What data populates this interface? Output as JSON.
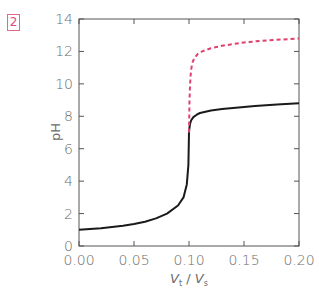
{
  "badge": "2",
  "chart_data": {
    "type": "line",
    "title": "",
    "xlabel": "Vt / Vs",
    "ylabel": "pH",
    "xlim": [
      0.0,
      0.2
    ],
    "ylim": [
      0,
      14
    ],
    "xticks": [
      "0.00",
      "0.05",
      "0.10",
      "0.15",
      "0.20"
    ],
    "yticks": [
      "0",
      "2",
      "4",
      "6",
      "8",
      "10",
      "12",
      "14"
    ],
    "grid": false,
    "legend": null,
    "series": [
      {
        "name": "solid-black-curve",
        "style": "solid",
        "color": "#1a1a1a",
        "x": [
          0.0,
          0.02,
          0.04,
          0.05,
          0.06,
          0.07,
          0.08,
          0.09,
          0.095,
          0.098,
          0.0995,
          0.1,
          0.1005,
          0.101,
          0.102,
          0.104,
          0.107,
          0.11,
          0.12,
          0.13,
          0.14,
          0.15,
          0.16,
          0.18,
          0.2
        ],
        "y": [
          1.0,
          1.1,
          1.25,
          1.35,
          1.5,
          1.7,
          2.0,
          2.5,
          3.0,
          3.8,
          5.0,
          7.0,
          7.3,
          7.55,
          7.75,
          7.95,
          8.1,
          8.2,
          8.35,
          8.45,
          8.52,
          8.58,
          8.63,
          8.72,
          8.8
        ]
      },
      {
        "name": "dashed-red-curve",
        "style": "dashed",
        "color": "#e0406e",
        "x": [
          0.1,
          0.1005,
          0.101,
          0.1015,
          0.102,
          0.103,
          0.105,
          0.108,
          0.112,
          0.12,
          0.13,
          0.14,
          0.15,
          0.16,
          0.18,
          0.2
        ],
        "y": [
          7.0,
          9.0,
          10.0,
          10.5,
          10.9,
          11.3,
          11.6,
          11.85,
          12.0,
          12.2,
          12.35,
          12.45,
          12.55,
          12.62,
          12.72,
          12.8
        ]
      }
    ]
  }
}
